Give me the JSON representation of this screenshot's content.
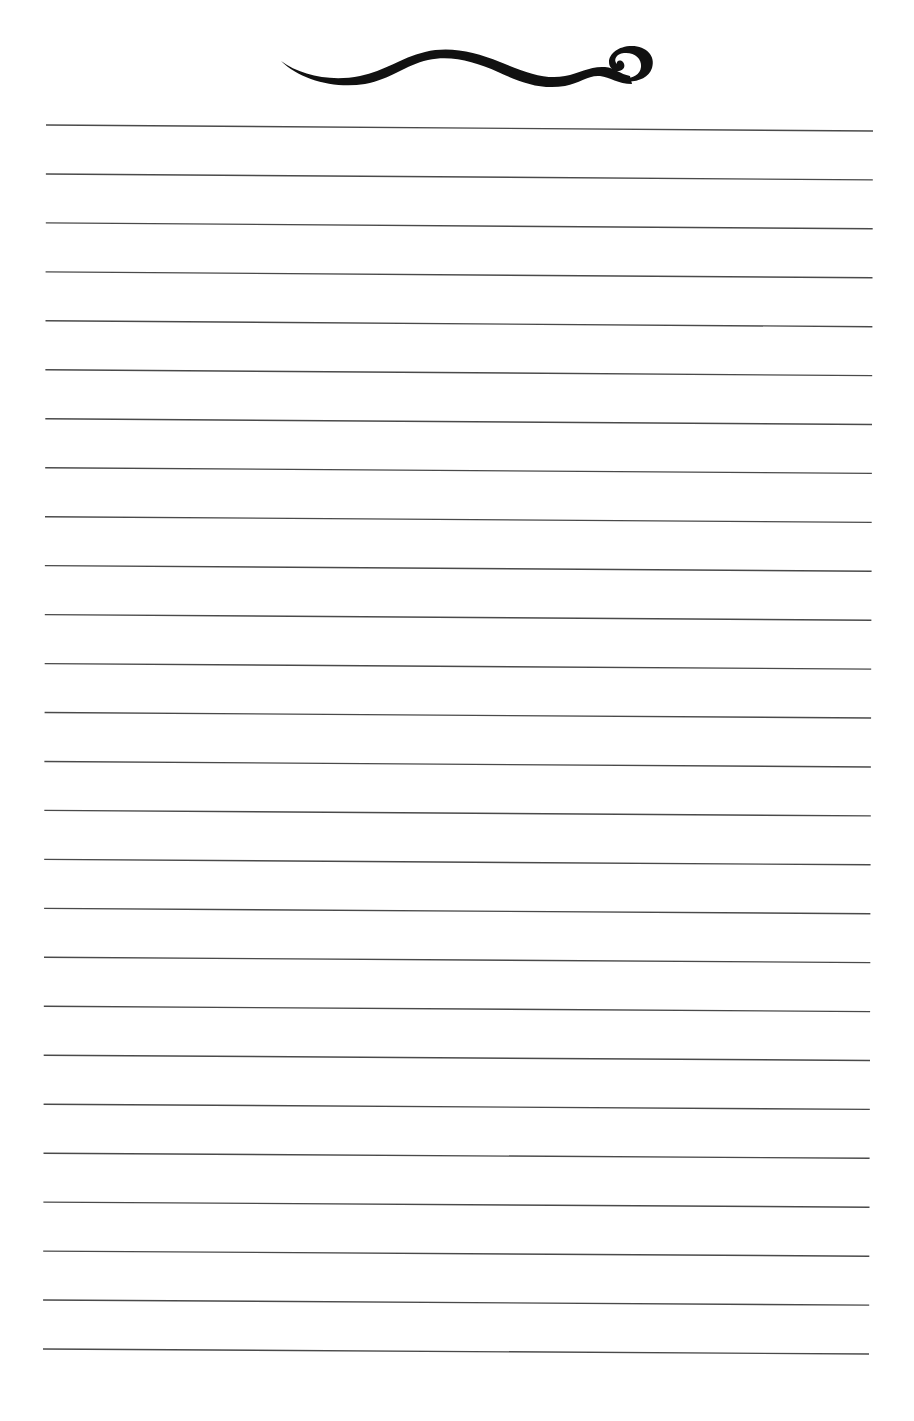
{
  "document": {
    "type": "lined-notepaper",
    "ornament": {
      "name": "swirl-flourish",
      "color": "#111111"
    },
    "rules": {
      "count": 26,
      "color": "#4a4a4a",
      "thickness": 1.4,
      "first_left": [
        46,
        125
      ],
      "first_right": [
        873,
        131
      ],
      "last_left": [
        43,
        1349
      ],
      "last_right": [
        869,
        1354
      ]
    }
  }
}
